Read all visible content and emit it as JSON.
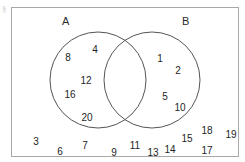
{
  "diagram": {
    "type": "venn",
    "title": "",
    "universe_label": "",
    "corner_mark": "§",
    "sets": [
      {
        "id": "A",
        "label": "A",
        "label_x": 62,
        "label_y": 22,
        "cx": 98,
        "cy": 80,
        "r": 48
      },
      {
        "id": "B",
        "label": "B",
        "label_x": 182,
        "label_y": 22,
        "cx": 152,
        "cy": 80,
        "r": 48
      }
    ],
    "regions": {
      "a_only": [
        "8",
        "4",
        "12",
        "16",
        "20"
      ],
      "intersection": [],
      "b_only": [
        "1",
        "2",
        "5",
        "10"
      ],
      "outside": [
        "3",
        "6",
        "7",
        "9",
        "11",
        "13",
        "14",
        "15",
        "17",
        "18",
        "19"
      ]
    },
    "elements": [
      {
        "value": "8",
        "region": "a_only",
        "x": 68,
        "y": 57
      },
      {
        "value": "4",
        "region": "a_only",
        "x": 95,
        "y": 49
      },
      {
        "value": "12",
        "region": "a_only",
        "x": 86,
        "y": 80
      },
      {
        "value": "16",
        "region": "a_only",
        "x": 70,
        "y": 94
      },
      {
        "value": "20",
        "region": "a_only",
        "x": 87,
        "y": 117
      },
      {
        "value": "1",
        "region": "b_only",
        "x": 160,
        "y": 58
      },
      {
        "value": "2",
        "region": "b_only",
        "x": 178,
        "y": 70
      },
      {
        "value": "5",
        "region": "b_only",
        "x": 165,
        "y": 96
      },
      {
        "value": "10",
        "region": "b_only",
        "x": 180,
        "y": 107
      },
      {
        "value": "3",
        "region": "outside",
        "x": 36,
        "y": 141
      },
      {
        "value": "6",
        "region": "outside",
        "x": 60,
        "y": 151
      },
      {
        "value": "7",
        "region": "outside",
        "x": 85,
        "y": 145
      },
      {
        "value": "9",
        "region": "outside",
        "x": 114,
        "y": 152
      },
      {
        "value": "11",
        "region": "outside",
        "x": 135,
        "y": 145
      },
      {
        "value": "13",
        "region": "outside",
        "x": 153,
        "y": 152
      },
      {
        "value": "14",
        "region": "outside",
        "x": 170,
        "y": 149
      },
      {
        "value": "15",
        "region": "outside",
        "x": 187,
        "y": 138
      },
      {
        "value": "17",
        "region": "outside",
        "x": 207,
        "y": 150
      },
      {
        "value": "18",
        "region": "outside",
        "x": 207,
        "y": 130
      },
      {
        "value": "19",
        "region": "outside",
        "x": 231,
        "y": 134
      }
    ]
  },
  "colors": {
    "frame": "#a8a8a8",
    "circle_stroke": "#555555",
    "text": "#1e1e1e",
    "background": "#ffffff"
  }
}
